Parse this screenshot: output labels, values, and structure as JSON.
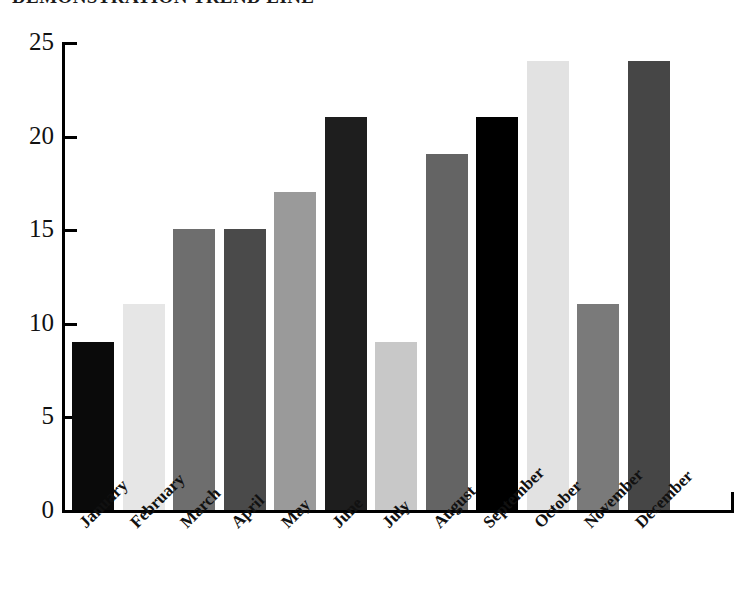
{
  "chart_data": {
    "type": "bar",
    "title": "DEMONSTRATION TREND LINE",
    "xlabel": "",
    "ylabel": "",
    "categories": [
      "January",
      "February",
      "March",
      "April",
      "May",
      "June",
      "July",
      "August",
      "September",
      "October",
      "November",
      "December"
    ],
    "values": [
      9,
      11,
      15,
      15,
      17,
      21,
      9,
      19,
      21,
      24,
      11,
      24
    ],
    "bar_colors": [
      "#0a0a0a",
      "#e6e6e6",
      "#6e6e6e",
      "#4a4a4a",
      "#9a9a9a",
      "#1e1e1e",
      "#c8c8c8",
      "#646464",
      "#000000",
      "#e2e2e2",
      "#7a7a7a",
      "#464646"
    ],
    "ylim": [
      0,
      25
    ],
    "yticks": [
      0,
      5,
      10,
      15,
      20,
      25
    ],
    "ytick_labels": [
      "0",
      "5",
      "10",
      "15",
      "20",
      "25"
    ],
    "grid": false,
    "legend": false,
    "legend_position": "none",
    "axis_color": "#000000",
    "background_color": "#ffffff",
    "xtick_rotation": -45
  }
}
